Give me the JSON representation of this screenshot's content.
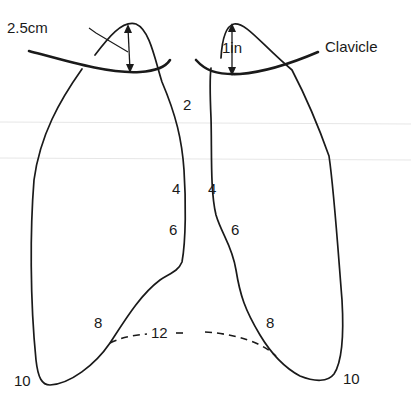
{
  "diagram": {
    "measurements": {
      "left_apex_height": "2.5cm",
      "right_apex_height": "1in"
    },
    "structures": {
      "clavicle_label": "Clavicle"
    },
    "rib_labels": {
      "left": {
        "rib2": "2",
        "rib4": "4",
        "rib6": "6",
        "rib8": "8",
        "rib10": "10"
      },
      "right": {
        "rib4": "4",
        "rib6": "6",
        "rib8": "8",
        "rib10": "10"
      },
      "pleura_lower_border": "12"
    },
    "colors": {
      "line": "#1a1a1a",
      "background": "#ffffff"
    }
  }
}
